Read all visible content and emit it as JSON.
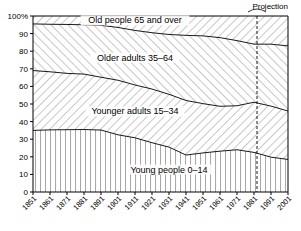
{
  "chart_data": {
    "type": "area",
    "title": "",
    "subtitle": "",
    "xlabel": "",
    "ylabel": "",
    "stacked": true,
    "percent": true,
    "grid": false,
    "legend_position": "inline-band-labels",
    "xlim": [
      1851,
      2001
    ],
    "ylim": [
      0,
      100
    ],
    "ytick_labels": [
      "0",
      "10",
      "20",
      "30",
      "40",
      "50",
      "60",
      "70",
      "80",
      "90",
      "100%"
    ],
    "ytick_values": [
      0,
      10,
      20,
      30,
      40,
      50,
      60,
      70,
      80,
      90,
      100
    ],
    "x": [
      1851,
      1861,
      1871,
      1881,
      1891,
      1901,
      1911,
      1921,
      1931,
      1941,
      1951,
      1961,
      1971,
      1981,
      1991,
      2001
    ],
    "xtick_labels": [
      "1851",
      "1861",
      "1871",
      "1881",
      "1891",
      "1901",
      "1911",
      "1921",
      "1931",
      "1941",
      "1951",
      "1961",
      "1971",
      "1981",
      "1991",
      "2001"
    ],
    "series": [
      {
        "name": "Young people 0–14",
        "label": "Young people 0–14",
        "hatch": "vertical",
        "values": [
          35.0,
          35.3,
          35.4,
          35.5,
          35.2,
          32.5,
          30.8,
          28.0,
          25.5,
          21.0,
          22.2,
          23.2,
          24.0,
          22.5,
          19.8,
          18.5
        ]
      },
      {
        "name": "Younger adults 15–34",
        "label": "Younger adults 15–34",
        "hatch": "forward-slash",
        "values": [
          34.0,
          33.0,
          32.0,
          31.5,
          30.0,
          31.0,
          30.0,
          30.5,
          30.0,
          31.0,
          28.0,
          25.5,
          25.0,
          28.5,
          29.0,
          27.5
        ]
      },
      {
        "name": "Older adults 35–64",
        "label": "Older adults 35–64",
        "hatch": "back-slash",
        "values": [
          26.5,
          27.0,
          27.8,
          28.0,
          29.5,
          30.0,
          31.0,
          32.0,
          34.0,
          37.0,
          38.5,
          39.0,
          37.0,
          33.0,
          35.2,
          37.0
        ]
      },
      {
        "name": "Old people 65 and over",
        "label": "Old people 65 and over",
        "hatch": "forward-slash",
        "values": [
          4.5,
          4.7,
          4.8,
          5.0,
          5.3,
          6.5,
          8.2,
          9.5,
          10.5,
          11.0,
          11.3,
          12.3,
          14.0,
          16.0,
          16.0,
          17.0
        ]
      }
    ],
    "annotations": [
      {
        "name": "projection",
        "text": "Projection",
        "at_x": 1981,
        "marker": "dashed-vertical-line-with-brace"
      }
    ]
  },
  "axis": {
    "y_unit_suffix": "%",
    "x_axis_name": "Census year"
  }
}
